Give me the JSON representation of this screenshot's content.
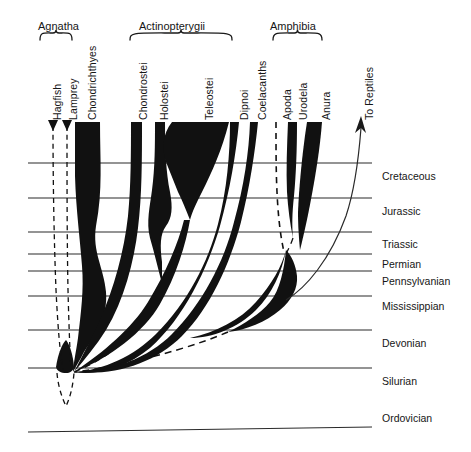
{
  "figure": {
    "ink_color": "#111111",
    "line_color": "#2a2a2a",
    "background": "#ffffff"
  },
  "group_brackets": [
    {
      "label": "Agnatha",
      "x1": 40,
      "x2": 72,
      "label_x": 38,
      "label_y": 20,
      "bracket_y": 30
    },
    {
      "label": "Actinopterygii",
      "x1": 130,
      "x2": 232,
      "label_x": 139,
      "label_y": 20,
      "bracket_y": 30
    },
    {
      "label": "Amphibia",
      "x1": 273,
      "x2": 322,
      "label_x": 270,
      "label_y": 20,
      "bracket_y": 30
    }
  ],
  "taxa": [
    {
      "name": "Hagfish",
      "label_x": 51,
      "label_y": 120,
      "style": "dashed"
    },
    {
      "name": "Lamprey",
      "label_x": 67,
      "label_y": 120,
      "style": "dashed"
    },
    {
      "name": "Chondrichthyes",
      "label_x": 86,
      "label_y": 120,
      "style": "solid"
    },
    {
      "name": "Chondrostei",
      "label_x": 137,
      "label_y": 120,
      "style": "solid"
    },
    {
      "name": "Holostei",
      "label_x": 158,
      "label_y": 120,
      "style": "solid"
    },
    {
      "name": "Teleostei",
      "label_x": 203,
      "label_y": 120,
      "style": "solid"
    },
    {
      "name": "Dipnoi",
      "label_x": 238,
      "label_y": 120,
      "style": "solid"
    },
    {
      "name": "Coelacanths",
      "label_x": 256,
      "label_y": 120,
      "style": "solid"
    },
    {
      "name": "Apoda",
      "label_x": 281,
      "label_y": 120,
      "style": "dashed"
    },
    {
      "name": "Urodela",
      "label_x": 297,
      "label_y": 120,
      "style": "solid"
    },
    {
      "name": "Anura",
      "label_x": 320,
      "label_y": 120,
      "style": "solid"
    },
    {
      "name": "To Reptiles",
      "label_x": 363,
      "label_y": 120,
      "style": "arrow"
    }
  ],
  "periods": [
    {
      "name": "Cretaceous",
      "line_y": 163,
      "label_x": 382,
      "label_y": 170
    },
    {
      "name": "Jurassic",
      "line_y": 198,
      "label_x": 382,
      "label_y": 205
    },
    {
      "name": "Triassic",
      "line_y": 232,
      "label_x": 382,
      "label_y": 238
    },
    {
      "name": "Permian",
      "line_y": 254,
      "label_x": 382,
      "label_y": 258
    },
    {
      "name": "Pennsylvanian",
      "line_y": 271,
      "label_x": 382,
      "label_y": 275
    },
    {
      "name": "Mississippian",
      "line_y": 296,
      "label_x": 382,
      "label_y": 300
    },
    {
      "name": "Devonian",
      "line_y": 330,
      "label_x": 382,
      "label_y": 337
    },
    {
      "name": "Silurian",
      "line_y": 368,
      "label_x": 382,
      "label_y": 375
    },
    {
      "name": "Ordovician",
      "line_y": 430,
      "label_x": 382,
      "label_y": 412
    }
  ],
  "timeline": {
    "x_start": 28,
    "x_end": 372,
    "note": "horizontal period boundary lines"
  },
  "root": {
    "x": 72,
    "y": 372,
    "label": "common ancestral stock"
  }
}
